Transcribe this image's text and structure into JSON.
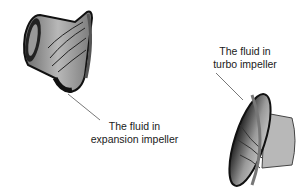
{
  "diagram": {
    "components": [
      {
        "id": "expansion",
        "label_line1": "The fluid in",
        "label_line2": "expansion impeller"
      },
      {
        "id": "turbo",
        "label_line1": "The fluid in",
        "label_line2": "turbo impeller"
      }
    ],
    "colors": {
      "body_dark": "#1a1a1a",
      "body_mid": "#8a8a8a",
      "body_light": "#c8c8c8",
      "leader": "#555555"
    }
  }
}
